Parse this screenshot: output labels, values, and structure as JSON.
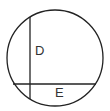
{
  "diagram": {
    "type": "circle-with-chords",
    "stroke_color": "#222222",
    "background": "#ffffff",
    "circle": {
      "cx": 55,
      "cy": 58,
      "r": 48
    },
    "chords": [
      {
        "id": "vertical",
        "x1": 30,
        "y1": 17,
        "x2": 30,
        "y2": 99
      },
      {
        "id": "horizontal",
        "x1": 13,
        "y1": 84,
        "x2": 96,
        "y2": 84
      }
    ],
    "labels": [
      {
        "id": "D",
        "text": "D",
        "x": 35,
        "y": 55
      },
      {
        "id": "E",
        "text": "E",
        "x": 55,
        "y": 97
      }
    ]
  }
}
